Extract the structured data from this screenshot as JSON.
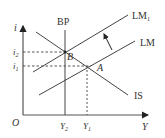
{
  "diagram": {
    "type": "IS-LM-BP",
    "colors": {
      "line": "#333333",
      "background": "#ffffff"
    },
    "axes": {
      "y_label": "i",
      "x_label": "Y",
      "origin_label": "O"
    },
    "curves": [
      {
        "id": "BP",
        "label": "BP"
      },
      {
        "id": "LM",
        "label": "LM"
      },
      {
        "id": "LM1",
        "label": "LM",
        "subscript": "1"
      },
      {
        "id": "IS",
        "label": "IS"
      }
    ],
    "points": [
      {
        "id": "A",
        "label": "A"
      },
      {
        "id": "B",
        "label": "B"
      }
    ],
    "y_ticks": [
      {
        "label": "i",
        "subscript": "2"
      },
      {
        "label": "i",
        "subscript": "1"
      }
    ],
    "x_ticks": [
      {
        "label": "Y",
        "subscript": "2"
      },
      {
        "label": "Y",
        "subscript": "1"
      }
    ],
    "shift_arrow": {
      "from": "LM",
      "to": "LM1"
    }
  }
}
